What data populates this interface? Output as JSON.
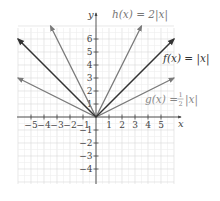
{
  "chart_data": {
    "type": "line",
    "title": "",
    "xlabel": "x",
    "ylabel": "y",
    "xlim": [
      -6,
      6
    ],
    "ylim": [
      -5,
      7
    ],
    "grid": true,
    "x_ticks": [
      -5,
      -4,
      -3,
      -2,
      -1,
      1,
      2,
      3,
      4,
      5
    ],
    "y_ticks": [
      -4,
      -3,
      -2,
      -1,
      1,
      2,
      3,
      4,
      5,
      6
    ],
    "series": [
      {
        "name": "f(x) = |x|",
        "label": "f(x) = |x|",
        "color": "#333333",
        "points": [
          [
            -6,
            6
          ],
          [
            0,
            0
          ],
          [
            6,
            6
          ]
        ]
      },
      {
        "name": "h(x) = 2|x|",
        "label": "h(x) = 2|x|",
        "color": "#7a7a7a",
        "points": [
          [
            -3.5,
            7
          ],
          [
            0,
            0
          ],
          [
            3.5,
            7
          ]
        ]
      },
      {
        "name": "g(x) = 1/2|x|",
        "label": "g(x) = ½|x|",
        "color": "#7a7a7a",
        "points": [
          [
            -6,
            3
          ],
          [
            0,
            0
          ],
          [
            6,
            3
          ]
        ]
      }
    ]
  },
  "labels": {
    "x_axis": "x",
    "y_axis": "y",
    "f": "f(x) = |x|",
    "h": "h(x) = 2|x|",
    "g_prefix": "g(x) = ",
    "g_frac_num": "1",
    "g_frac_den": "2",
    "g_suffix": "|x|"
  }
}
